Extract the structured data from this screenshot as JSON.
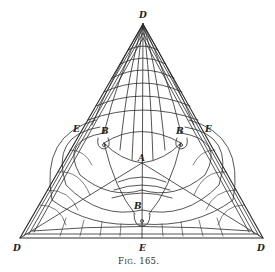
{
  "figure": {
    "caption_prefix": "F",
    "caption_smallcaps": "IG",
    "caption_number": ". 165.",
    "line_color": "#2a2a2a",
    "background": "#ffffff"
  },
  "labels": {
    "apex_top": "D",
    "vertex_bottom_left": "D",
    "vertex_bottom_right": "D",
    "edge_left": "E",
    "edge_right": "E",
    "edge_bottom": "E",
    "center": "A",
    "saddle_left": "B",
    "saddle_right": "B",
    "saddle_bottom": "B"
  },
  "geometry": {
    "apex": [
      143,
      24
    ],
    "bottom_left": [
      20,
      238
    ],
    "bottom_right": [
      263,
      238
    ],
    "center_A": [
      142,
      163
    ],
    "B_left": [
      104,
      143
    ],
    "B_right": [
      181,
      143
    ],
    "B_bottom": [
      142,
      214
    ]
  }
}
